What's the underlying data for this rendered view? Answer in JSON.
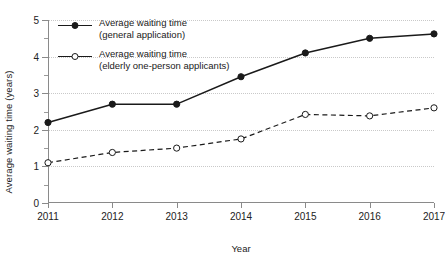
{
  "chart_data": {
    "type": "line",
    "title": "",
    "xlabel": "Year",
    "ylabel": "Average waiting time (years)",
    "categories": [
      "2011",
      "2012",
      "2013",
      "2014",
      "2015",
      "2016",
      "2017"
    ],
    "x": [
      2011,
      2012,
      2013,
      2014,
      2015,
      2016,
      2017
    ],
    "xlim": [
      2011,
      2017
    ],
    "ylim": [
      0,
      5
    ],
    "y_major_ticks": [
      0,
      1,
      2,
      3,
      4,
      5
    ],
    "y_minor_ticks": [
      0.5,
      1.5,
      2.5,
      3.5,
      4.5
    ],
    "y_tick_labels": [
      "0",
      "1",
      "2",
      "3",
      "4",
      "5"
    ],
    "grid": "horizontal-dotted",
    "legend_position": "top-left-inside",
    "series": [
      {
        "name": "Average waiting time (general application)",
        "legend_line1": "Average waiting time",
        "legend_line2": "(general application)",
        "marker": "filled-circle",
        "linestyle": "solid",
        "color": "#1a1a1a",
        "values": [
          2.2,
          2.7,
          2.7,
          3.45,
          4.1,
          4.5,
          4.62
        ]
      },
      {
        "name": "Average waiting time (elderly one-person applicants)",
        "legend_line1": "Average waiting time",
        "legend_line2": "(elderly one-person applicants)",
        "marker": "open-circle",
        "linestyle": "dashed",
        "color": "#1a1a1a",
        "values": [
          1.1,
          1.38,
          1.5,
          1.75,
          2.42,
          2.38,
          2.6
        ]
      }
    ]
  },
  "colors": {
    "grid": "#c9c9c9",
    "axis": "#8a8a8a",
    "text": "#1a1a1a",
    "background": "#ffffff"
  }
}
